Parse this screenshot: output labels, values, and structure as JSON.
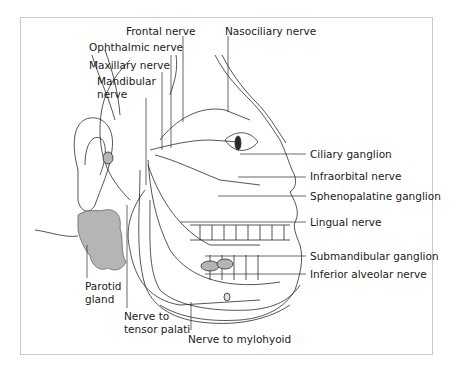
{
  "figure": {
    "labels": {
      "frontal_nerve": "Frontal nerve",
      "nasociliary_nerve": "Nasociliary nerve",
      "ophthalmic_nerve": "Ophthalmic nerve",
      "maxillary_nerve": "Maxillary nerve",
      "mandibular_nerve": "Mandibular\nnerve",
      "ciliary_ganglion": "Ciliary ganglion",
      "infraorbital_nerve": "Infraorbital nerve",
      "sphenopalatine_ganglion": "Sphenopalatine ganglion",
      "lingual_nerve": "Lingual nerve",
      "submandibular_ganglion": "Submandibular ganglion",
      "inferior_alveolar_nerve": "Inferior alveolar nerve",
      "parotid_gland": "Parotid\ngland",
      "nerve_to_tensor_palati": "Nerve to\ntensor palati",
      "nerve_to_mylohyoid": "Nerve to mylohyoid"
    },
    "colors": {
      "line": "#2a2a2a",
      "gland_fill": "#b5b5b5",
      "frame": "#c8c8c8"
    }
  }
}
